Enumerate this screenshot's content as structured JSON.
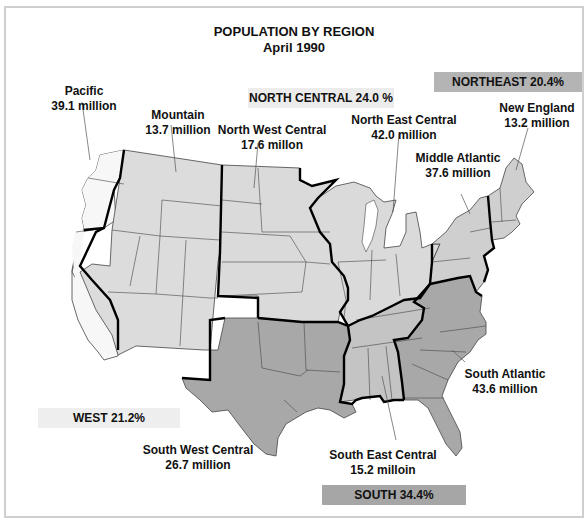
{
  "title": {
    "line1": "POPULATION BY REGION",
    "line2": "April 1990"
  },
  "colors": {
    "west_pacific": "#f7f7f7",
    "west_mountain": "#dcdcdc",
    "north_central": "#dadada",
    "northeast": "#cfcfcf",
    "south_central_east": "#c4c4c4",
    "south_dark": "#a8a8a8",
    "region_border": "#000000",
    "state_border": "#444444",
    "banner_north_central": "#ececec",
    "banner_northeast": "#b4b4b4",
    "banner_west": "#eeeeee",
    "banner_south": "#a6a6a6"
  },
  "regions": {
    "north_central": {
      "label": "NORTH CENTRAL 24.0 %"
    },
    "northeast": {
      "label": "NORTHEAST 20.4%"
    },
    "west": {
      "label": "WEST 21.2%"
    },
    "south": {
      "label": "SOUTH 34.4%"
    }
  },
  "divisions": {
    "pacific": {
      "name": "Pacific",
      "population": "39.1 million"
    },
    "mountain": {
      "name": "Mountain",
      "population": "13.7 million"
    },
    "north_west_central": {
      "name": "North West Central",
      "population": "17.6 millon"
    },
    "north_east_central": {
      "name": "North East Central",
      "population": "42.0 million"
    },
    "new_england": {
      "name": "New England",
      "population": "13.2  million"
    },
    "middle_atlantic": {
      "name": "Middle Atlantic",
      "population": "37.6 million"
    },
    "south_atlantic": {
      "name": "South Atlantic",
      "population": "43.6 million"
    },
    "south_west_central": {
      "name": "South West Central",
      "population": "26.7 million"
    },
    "south_east_central": {
      "name": "South East Central",
      "population": "15.2 milloin"
    }
  }
}
